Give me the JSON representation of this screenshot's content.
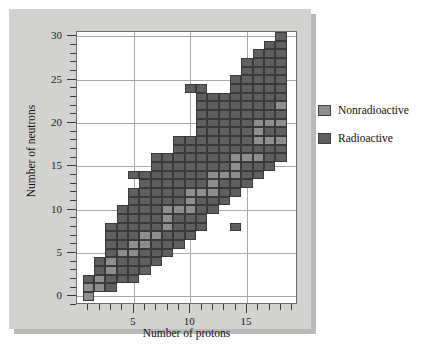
{
  "chart_data": {
    "type": "heatmap",
    "title": "",
    "xlabel": "Number of protons",
    "ylabel": "Number of neutrons",
    "xlim": [
      0,
      19.5
    ],
    "ylim": [
      -1,
      30.5
    ],
    "xticks": [
      5,
      10,
      15
    ],
    "yticks": [
      0,
      5,
      10,
      15,
      20,
      25,
      30
    ],
    "xticklabels": [
      "5",
      "10",
      "15"
    ],
    "yticklabels": [
      "0",
      "5",
      "10",
      "15",
      "20",
      "25",
      "30"
    ],
    "grid": true,
    "legend_position": "right",
    "categories": [
      "Nonradioactive",
      "Radioactive"
    ],
    "colors": {
      "nonradioactive": "#8e8e8e",
      "radioactive": "#5f5f5f",
      "cell_border": "#3a3a3a",
      "panel_background": "#d2d2d0",
      "plot_background": "#ffffff",
      "gridline": "#a8a8a8",
      "axis": "#3a3a3a",
      "shadow": "#b9b9b9"
    },
    "cell_size_units": 1,
    "nonradioactive_cells": [
      [
        1,
        0
      ],
      [
        1,
        1
      ],
      [
        2,
        1
      ],
      [
        2,
        2
      ],
      [
        3,
        3
      ],
      [
        3,
        4
      ],
      [
        4,
        5
      ],
      [
        5,
        5
      ],
      [
        5,
        6
      ],
      [
        6,
        6
      ],
      [
        6,
        7
      ],
      [
        7,
        7
      ],
      [
        8,
        8
      ],
      [
        8,
        9
      ],
      [
        8,
        10
      ],
      [
        9,
        10
      ],
      [
        10,
        10
      ],
      [
        10,
        11
      ],
      [
        10,
        12
      ],
      [
        11,
        12
      ],
      [
        12,
        12
      ],
      [
        12,
        13
      ],
      [
        12,
        14
      ],
      [
        13,
        14
      ],
      [
        14,
        14
      ],
      [
        14,
        15
      ],
      [
        14,
        16
      ],
      [
        15,
        16
      ],
      [
        16,
        16
      ],
      [
        16,
        18
      ],
      [
        16,
        19
      ],
      [
        16,
        20
      ],
      [
        17,
        18
      ],
      [
        17,
        20
      ],
      [
        18,
        18
      ],
      [
        18,
        20
      ],
      [
        18,
        22
      ]
    ],
    "radioactive_cells": [
      [
        1,
        2
      ],
      [
        2,
        3
      ],
      [
        2,
        4
      ],
      [
        3,
        1
      ],
      [
        3,
        2
      ],
      [
        3,
        5
      ],
      [
        3,
        6
      ],
      [
        3,
        7
      ],
      [
        3,
        8
      ],
      [
        4,
        2
      ],
      [
        4,
        3
      ],
      [
        4,
        4
      ],
      [
        4,
        6
      ],
      [
        4,
        7
      ],
      [
        4,
        8
      ],
      [
        4,
        9
      ],
      [
        4,
        10
      ],
      [
        5,
        2
      ],
      [
        5,
        3
      ],
      [
        5,
        4
      ],
      [
        5,
        7
      ],
      [
        5,
        8
      ],
      [
        5,
        9
      ],
      [
        5,
        10
      ],
      [
        5,
        11
      ],
      [
        5,
        12
      ],
      [
        5,
        14
      ],
      [
        6,
        3
      ],
      [
        6,
        4
      ],
      [
        6,
        5
      ],
      [
        6,
        8
      ],
      [
        6,
        9
      ],
      [
        6,
        10
      ],
      [
        6,
        11
      ],
      [
        6,
        12
      ],
      [
        6,
        13
      ],
      [
        6,
        14
      ],
      [
        7,
        4
      ],
      [
        7,
        5
      ],
      [
        7,
        6
      ],
      [
        7,
        8
      ],
      [
        7,
        9
      ],
      [
        7,
        10
      ],
      [
        7,
        11
      ],
      [
        7,
        12
      ],
      [
        7,
        13
      ],
      [
        7,
        14
      ],
      [
        7,
        15
      ],
      [
        7,
        16
      ],
      [
        8,
        5
      ],
      [
        8,
        6
      ],
      [
        8,
        7
      ],
      [
        8,
        11
      ],
      [
        8,
        12
      ],
      [
        8,
        13
      ],
      [
        8,
        14
      ],
      [
        8,
        15
      ],
      [
        8,
        16
      ],
      [
        9,
        6
      ],
      [
        9,
        7
      ],
      [
        9,
        8
      ],
      [
        9,
        9
      ],
      [
        9,
        11
      ],
      [
        9,
        12
      ],
      [
        9,
        13
      ],
      [
        9,
        14
      ],
      [
        9,
        15
      ],
      [
        9,
        16
      ],
      [
        9,
        17
      ],
      [
        9,
        18
      ],
      [
        10,
        7
      ],
      [
        10,
        8
      ],
      [
        10,
        9
      ],
      [
        10,
        13
      ],
      [
        10,
        14
      ],
      [
        10,
        15
      ],
      [
        10,
        16
      ],
      [
        10,
        17
      ],
      [
        10,
        18
      ],
      [
        10,
        24
      ],
      [
        11,
        8
      ],
      [
        11,
        9
      ],
      [
        11,
        10
      ],
      [
        11,
        11
      ],
      [
        11,
        13
      ],
      [
        11,
        14
      ],
      [
        11,
        15
      ],
      [
        11,
        16
      ],
      [
        11,
        17
      ],
      [
        11,
        18
      ],
      [
        11,
        19
      ],
      [
        11,
        20
      ],
      [
        11,
        21
      ],
      [
        11,
        22
      ],
      [
        11,
        23
      ],
      [
        11,
        24
      ],
      [
        12,
        10
      ],
      [
        12,
        11
      ],
      [
        12,
        15
      ],
      [
        12,
        16
      ],
      [
        12,
        17
      ],
      [
        12,
        18
      ],
      [
        12,
        19
      ],
      [
        12,
        20
      ],
      [
        12,
        21
      ],
      [
        12,
        22
      ],
      [
        12,
        23
      ],
      [
        13,
        11
      ],
      [
        13,
        12
      ],
      [
        13,
        13
      ],
      [
        13,
        15
      ],
      [
        13,
        16
      ],
      [
        13,
        17
      ],
      [
        13,
        18
      ],
      [
        13,
        19
      ],
      [
        13,
        20
      ],
      [
        13,
        21
      ],
      [
        13,
        22
      ],
      [
        13,
        23
      ],
      [
        14,
        8
      ],
      [
        14,
        12
      ],
      [
        14,
        13
      ],
      [
        14,
        17
      ],
      [
        14,
        18
      ],
      [
        14,
        19
      ],
      [
        14,
        20
      ],
      [
        14,
        21
      ],
      [
        14,
        22
      ],
      [
        14,
        23
      ],
      [
        14,
        24
      ],
      [
        14,
        25
      ],
      [
        15,
        13
      ],
      [
        15,
        14
      ],
      [
        15,
        15
      ],
      [
        15,
        17
      ],
      [
        15,
        18
      ],
      [
        15,
        19
      ],
      [
        15,
        20
      ],
      [
        15,
        21
      ],
      [
        15,
        22
      ],
      [
        15,
        23
      ],
      [
        15,
        24
      ],
      [
        15,
        25
      ],
      [
        15,
        26
      ],
      [
        15,
        27
      ],
      [
        16,
        14
      ],
      [
        16,
        15
      ],
      [
        16,
        17
      ],
      [
        16,
        21
      ],
      [
        16,
        22
      ],
      [
        16,
        23
      ],
      [
        16,
        24
      ],
      [
        16,
        25
      ],
      [
        16,
        26
      ],
      [
        16,
        27
      ],
      [
        16,
        28
      ],
      [
        17,
        15
      ],
      [
        17,
        16
      ],
      [
        17,
        17
      ],
      [
        17,
        19
      ],
      [
        17,
        21
      ],
      [
        17,
        22
      ],
      [
        17,
        23
      ],
      [
        17,
        24
      ],
      [
        17,
        25
      ],
      [
        17,
        26
      ],
      [
        17,
        27
      ],
      [
        17,
        28
      ],
      [
        17,
        29
      ],
      [
        18,
        16
      ],
      [
        18,
        17
      ],
      [
        18,
        19
      ],
      [
        18,
        21
      ],
      [
        18,
        23
      ],
      [
        18,
        24
      ],
      [
        18,
        25
      ],
      [
        18,
        26
      ],
      [
        18,
        27
      ],
      [
        18,
        28
      ],
      [
        18,
        29
      ],
      [
        18,
        30
      ]
    ]
  },
  "legend": {
    "items": [
      {
        "label": "Nonradioactive",
        "key": "nonradioactive"
      },
      {
        "label": "Radioactive",
        "key": "radioactive"
      }
    ]
  }
}
